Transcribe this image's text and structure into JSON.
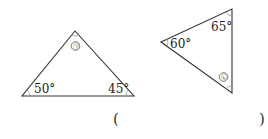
{
  "triangle_a": {
    "angles": {
      "left": "50°",
      "right": "45°",
      "top_marker": "㉠"
    }
  },
  "triangle_b": {
    "angles": {
      "left": "60°",
      "top": "65°",
      "bottom_marker": "㉡"
    }
  },
  "answer": {
    "open": "(",
    "close": ")",
    "value": ""
  }
}
